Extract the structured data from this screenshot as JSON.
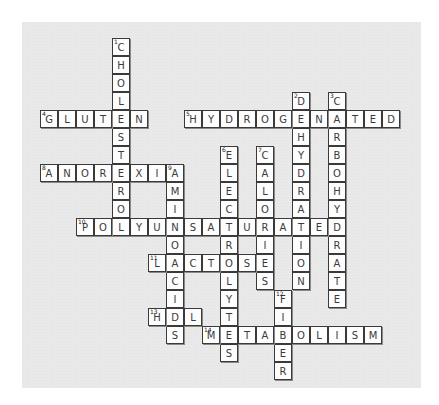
{
  "puzzle": {
    "cell_size": 18,
    "origin": {
      "x": 40,
      "y": 38
    },
    "colors": {
      "background": "#e9e9e9",
      "cell": "#fdfdfd",
      "border": "#3a3a3a",
      "text": "#3a3a3a"
    },
    "words": [
      {
        "num": "1",
        "dir": "down",
        "answer": "CHOLESTEROL",
        "row": 0,
        "col": 4
      },
      {
        "num": "2",
        "dir": "down",
        "answer": "DEHYDRATION",
        "row": 3,
        "col": 14
      },
      {
        "num": "3",
        "dir": "down",
        "answer": "CARBOHYDRATE",
        "row": 3,
        "col": 16
      },
      {
        "num": "4",
        "dir": "across",
        "answer": "GLUTEN",
        "row": 4,
        "col": 0
      },
      {
        "num": "5",
        "dir": "across",
        "answer": "HYDROGENATED",
        "row": 4,
        "col": 8
      },
      {
        "num": "6",
        "dir": "down",
        "answer": "ELECTROLYTES",
        "row": 6,
        "col": 10
      },
      {
        "num": "7",
        "dir": "down",
        "answer": "CALORIES",
        "row": 6,
        "col": 12
      },
      {
        "num": "8",
        "dir": "across",
        "answer": "ANOREXIA",
        "row": 7,
        "col": 0
      },
      {
        "num": "9",
        "dir": "down",
        "answer": "AMINOACIDS",
        "row": 7,
        "col": 7
      },
      {
        "num": "10",
        "dir": "across",
        "answer": "POLYUNSATURATED",
        "row": 10,
        "col": 2
      },
      {
        "num": "11",
        "dir": "across",
        "answer": "LACTOSE",
        "row": 12,
        "col": 6
      },
      {
        "num": "12",
        "dir": "down",
        "answer": "FIBER",
        "row": 14,
        "col": 13
      },
      {
        "num": "13",
        "dir": "across",
        "answer": "HDL",
        "row": 15,
        "col": 6
      },
      {
        "num": "14",
        "dir": "across",
        "answer": "METABOLISM",
        "row": 16,
        "col": 9
      }
    ]
  }
}
